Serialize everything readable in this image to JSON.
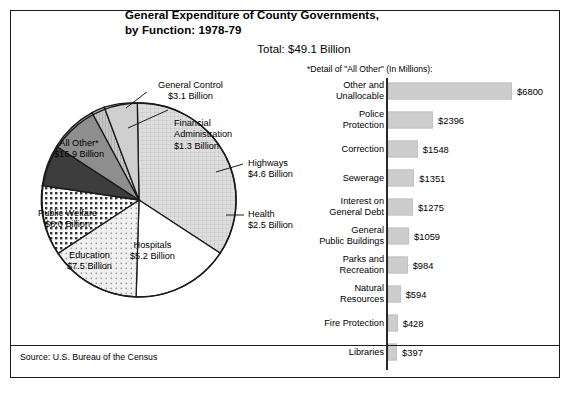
{
  "header": {
    "title_line1": "General Expenditure of County Governments,",
    "title_line2": "by Function: 1978-79",
    "total": "Total: $49.1 Billion",
    "detail_heading": "*Detail of \"All Other\" (In Millions):"
  },
  "footer": {
    "source": "Source: U.S. Bureau of the Census"
  },
  "chart_data": [
    {
      "type": "pie",
      "title": "General Expenditure of County Governments, by Function: 1978-79",
      "subtitle": "Total: $49.1 Billion",
      "unit": "Billion USD",
      "total": 49.1,
      "legend": "labels-on-slices-and-callouts",
      "slices": [
        {
          "label": "All Other*",
          "value": 16.9,
          "value_text": "$16.9 Billion",
          "pattern": "fine-grid",
          "color": "#d9d9d9"
        },
        {
          "label": "General Control",
          "value": 3.1,
          "value_text": "$3.1 Billion",
          "pattern": "fine-grid",
          "color": "#cccccc"
        },
        {
          "label": "Financial Administration",
          "value": 1.3,
          "value_text": "$1.3 Billion",
          "pattern": "vert-lines",
          "color": "#b4b4b4"
        },
        {
          "label": "Highways",
          "value": 4.6,
          "value_text": "$4.6 Billion",
          "pattern": "solid-gray",
          "color": "#8e8e8e"
        },
        {
          "label": "Health",
          "value": 2.5,
          "value_text": "$2.5 Billion",
          "pattern": "dark",
          "color": "#3d3d3d"
        },
        {
          "label": "Hospitals",
          "value": 5.2,
          "value_text": "$5.2 Billion",
          "pattern": "coarse-dots",
          "color": "#ffffff"
        },
        {
          "label": "Education",
          "value": 7.5,
          "value_text": "$7.5 Billion",
          "pattern": "fine-dots",
          "color": "#e6e6e6"
        },
        {
          "label": "Public Welfare",
          "value": 8.0,
          "value_text": "$8.0 Billion",
          "pattern": "white",
          "color": "#ffffff"
        }
      ]
    },
    {
      "type": "bar",
      "orientation": "horizontal",
      "title": "*Detail of \"All Other\" (In Millions):",
      "unit": "Millions USD",
      "xlabel": "",
      "ylabel": "",
      "xlim": [
        0,
        6800
      ],
      "grid": false,
      "categories": [
        "Other and Unallocable",
        "Police Protection",
        "Correction",
        "Sewerage",
        "Interest on General Debt",
        "General Public Buildings",
        "Parks and Recreation",
        "Natural Resources",
        "Fire Protection",
        "Libraries"
      ],
      "values": [
        6800,
        2396,
        1548,
        1351,
        1275,
        1059,
        984,
        594,
        428,
        397
      ],
      "bars": [
        {
          "label_line1": "Other and",
          "label_line2": "Unallocable",
          "value": 6800,
          "value_text": "$6800"
        },
        {
          "label_line1": "Police",
          "label_line2": "Protection",
          "value": 2396,
          "value_text": "$2396"
        },
        {
          "label_line1": "Correction",
          "label_line2": "",
          "value": 1548,
          "value_text": "$1548"
        },
        {
          "label_line1": "Sewerage",
          "label_line2": "",
          "value": 1351,
          "value_text": "$1351"
        },
        {
          "label_line1": "Interest on",
          "label_line2": "General Debt",
          "value": 1275,
          "value_text": "$1275"
        },
        {
          "label_line1": "General",
          "label_line2": "Public Buildings",
          "value": 1059,
          "value_text": "$1059"
        },
        {
          "label_line1": "Parks and",
          "label_line2": "Recreation",
          "value": 984,
          "value_text": "$984"
        },
        {
          "label_line1": "Natural",
          "label_line2": "Resources",
          "value": 594,
          "value_text": "$594"
        },
        {
          "label_line1": "Fire Protection",
          "label_line2": "",
          "value": 428,
          "value_text": "$428"
        },
        {
          "label_line1": "Libraries",
          "label_line2": "",
          "value": 397,
          "value_text": "$397"
        }
      ]
    }
  ],
  "colors": {
    "bar_fill": "#cdcdcd",
    "frame": "#1a1a1a",
    "text": "#000000"
  }
}
